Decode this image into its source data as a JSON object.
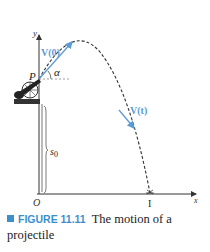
{
  "figure": {
    "axes": {
      "y_label": "y",
      "x_label": "x",
      "origin_label": "O"
    },
    "labels": {
      "launch_point": "P",
      "angle": "α",
      "initial_velocity": "V(0)",
      "velocity_t": "V(t)",
      "initial_height": "s",
      "initial_height_sub": "0",
      "impact_point": "I"
    },
    "colors": {
      "velocity_vector": "#5b9bd5",
      "trajectory": "#333333",
      "axes": "#333333",
      "accent": "#3b8fcf"
    }
  },
  "caption": {
    "figure_number": "FIGURE 11.11",
    "text": "The motion of a projectile"
  }
}
